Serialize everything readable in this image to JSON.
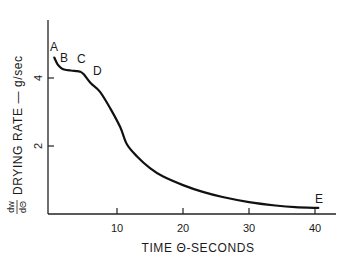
{
  "chart_data": {
    "type": "line",
    "title": "",
    "xlabel": "TIME Θ-SECONDS",
    "ylabel_fraction": {
      "numerator": "dw",
      "denominator": "dΘ"
    },
    "ylabel": "DRYING RATE — g/sec",
    "xlim": [
      0,
      43
    ],
    "ylim": [
      0,
      5.7
    ],
    "x_ticks": [
      10,
      20,
      30,
      40
    ],
    "x_tick_labels": [
      "10",
      "20",
      "30",
      "40"
    ],
    "y_ticks": [
      2,
      4
    ],
    "y_tick_labels": [
      "2",
      "4"
    ],
    "grid": false,
    "legend": null,
    "series": [
      {
        "name": "drying rate",
        "x": [
          0.5,
          1.0,
          1.5,
          2.0,
          3.0,
          4.0,
          4.5,
          5.0,
          6.0,
          7.4,
          9.0,
          10.5,
          11.5,
          13.0,
          15.0,
          17.0,
          20.0,
          23.0,
          26.0,
          30.0,
          34.0,
          37.0,
          40.5
        ],
        "y": [
          4.6,
          4.4,
          4.3,
          4.25,
          4.22,
          4.2,
          4.18,
          4.1,
          3.85,
          3.6,
          3.1,
          2.55,
          2.05,
          1.7,
          1.35,
          1.1,
          0.85,
          0.65,
          0.5,
          0.35,
          0.25,
          0.2,
          0.18
        ]
      }
    ],
    "annotations": [
      {
        "text": "A",
        "x": 0.2,
        "y": 4.7
      },
      {
        "text": "B",
        "x": 1.5,
        "y": 4.4
      },
      {
        "text": "C",
        "x": 4.1,
        "y": 4.35
      },
      {
        "text": "D",
        "x": 6.3,
        "y": 4.0
      },
      {
        "text": "E",
        "x": 40.0,
        "y": 0.35
      }
    ]
  }
}
